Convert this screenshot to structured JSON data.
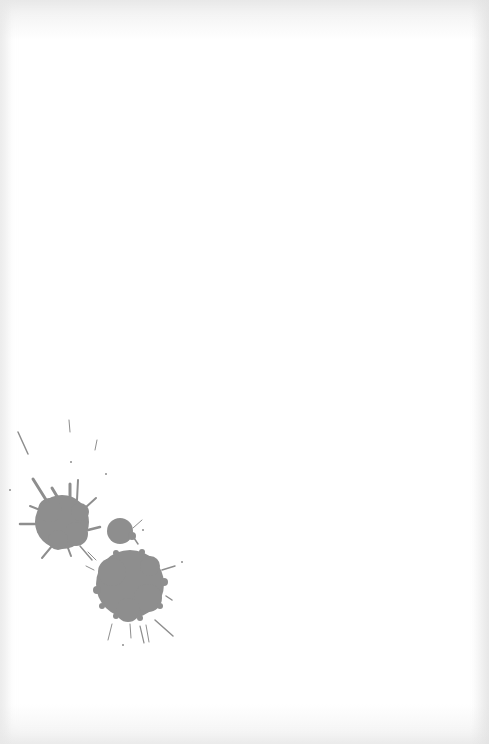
{
  "image": {
    "description": "Three gray ink splatters on a white paper background",
    "width": 489,
    "height": 744,
    "background_color": "#ffffff",
    "edge_tint": "#e2e2e2"
  },
  "splatters": [
    {
      "name": "ink-splatter-left",
      "cx": 62,
      "cy": 522,
      "r": 28,
      "color": "#8e8e8e"
    },
    {
      "name": "ink-splatter-small",
      "cx": 120,
      "cy": 531,
      "r": 14,
      "color": "#8e8e8e"
    },
    {
      "name": "ink-splatter-large",
      "cx": 130,
      "cy": 584,
      "r": 35,
      "color": "#8e8e8e"
    }
  ],
  "colors": {
    "ink": "#8e8e8e"
  }
}
